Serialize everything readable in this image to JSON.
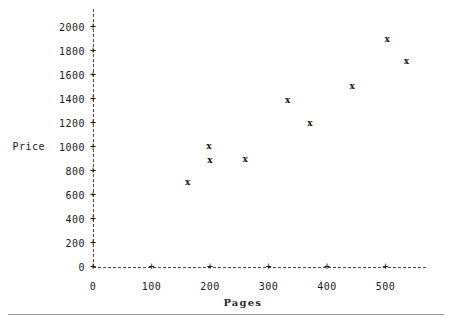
{
  "chart_data": {
    "type": "scatter",
    "title": "",
    "xlabel": "Pages",
    "ylabel": "Price",
    "marker": "x",
    "grid": false,
    "legend": null,
    "xlim": [
      0,
      570
    ],
    "ylim": [
      0,
      2000
    ],
    "x_ticks": [
      0,
      100,
      200,
      300,
      400,
      500
    ],
    "y_ticks": [
      0,
      200,
      400,
      600,
      800,
      1000,
      1200,
      1400,
      1600,
      1800,
      2000
    ],
    "x_tick_labels": [
      "0",
      "100",
      "200",
      "300",
      "400",
      "500"
    ],
    "y_tick_labels": [
      "0",
      "200",
      "400",
      "600",
      "800",
      "1000",
      "1200",
      "1400",
      "1600",
      "1800",
      "2000"
    ],
    "points": [
      {
        "x": 162,
        "y": 708
      },
      {
        "x": 198,
        "y": 1008
      },
      {
        "x": 200,
        "y": 892
      },
      {
        "x": 260,
        "y": 900
      },
      {
        "x": 333,
        "y": 1392
      },
      {
        "x": 371,
        "y": 1200
      },
      {
        "x": 443,
        "y": 1508
      },
      {
        "x": 503,
        "y": 1900
      },
      {
        "x": 536,
        "y": 1717
      }
    ]
  },
  "style": {
    "axis_color": "#4a4a4a",
    "text_color": "#1a1a1a",
    "background": "#ffffff",
    "rule_color": "#9a9a9a"
  }
}
